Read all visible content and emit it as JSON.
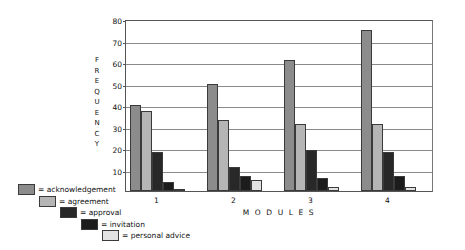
{
  "chart_data": {
    "type": "bar",
    "title": "",
    "xlabel": "M O D U L E S",
    "ylabel": "F R E Q U E N C Y",
    "categories": [
      "1",
      "2",
      "3",
      "4"
    ],
    "ylim": [
      0,
      80
    ],
    "yticks": [
      10,
      20,
      30,
      40,
      50,
      60,
      70,
      80
    ],
    "grid": true,
    "legend_position": "bottom-left",
    "series": [
      {
        "name": "acknowledgement",
        "color": "#8c8c8c",
        "values": [
          40,
          50,
          61,
          75
        ]
      },
      {
        "name": "agreement",
        "color": "#b5b5b5",
        "values": [
          37,
          33,
          31,
          31
        ]
      },
      {
        "name": "approval",
        "color": "#282828",
        "values": [
          18,
          11,
          19,
          18
        ]
      },
      {
        "name": "invitation",
        "color": "#1c1c1c",
        "values": [
          4,
          7,
          6,
          7
        ]
      },
      {
        "name": "personal advice",
        "color": "#e2e2e2",
        "values": [
          1,
          5,
          2,
          2
        ]
      }
    ]
  },
  "axis": {
    "y_title_letters": [
      "F",
      "R",
      "E",
      "Q",
      "U",
      "E",
      "N",
      "C",
      "Y"
    ],
    "x_title": "M O D U L E S"
  },
  "legend": {
    "items": [
      {
        "label": "= acknowledgement"
      },
      {
        "label": "= agreement"
      },
      {
        "label": "= approval"
      },
      {
        "label": "= invitation"
      },
      {
        "label": "= personal advice"
      }
    ]
  }
}
